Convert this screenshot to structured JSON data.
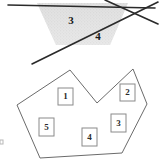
{
  "figure": {
    "width": 163,
    "height": 168,
    "background_color": "#ffffff"
  },
  "top_diagram": {
    "name": "intersecting-lines-with-shaded-region",
    "shaded_region": {
      "fill_color": "#e3e3e3",
      "pattern": "stippled-gray",
      "polygon_points": "37,3 128,3 110,45 56,45"
    },
    "lines": [
      {
        "name": "horizontal-line",
        "x1": 8,
        "y1": 5,
        "x2": 155,
        "y2": 8,
        "stroke_color": "#2a2a2a",
        "stroke_width": 1.6
      },
      {
        "name": "diagonal-line-rising",
        "x1": 32,
        "y1": 64,
        "x2": 158,
        "y2": 2,
        "stroke_color": "#2a2a2a",
        "stroke_width": 1.6
      },
      {
        "name": "diagonal-line-falling",
        "x1": 105,
        "y1": 0,
        "x2": 158,
        "y2": 24,
        "stroke_color": "#2a2a2a",
        "stroke_width": 1.6
      }
    ],
    "labels": [
      {
        "name": "angle-label-3",
        "text": "3",
        "x": 71,
        "y": 21
      },
      {
        "name": "angle-label-4",
        "text": "4",
        "x": 98,
        "y": 37
      }
    ]
  },
  "bottom_diagram": {
    "name": "concave-polygon-with-numbered-regions",
    "polygon": {
      "points": "70,70 97,103 133,69 147,104 122,153 40,158 17,105",
      "stroke_color": "#6b6b6b",
      "fill_color": "#ffffff"
    },
    "region_boxes": [
      {
        "name": "region-box-1",
        "label": "1",
        "x": 58,
        "y": 88,
        "w": 15,
        "h": 17
      },
      {
        "name": "region-box-2",
        "label": "2",
        "x": 120,
        "y": 84,
        "w": 15,
        "h": 17
      },
      {
        "name": "region-box-3",
        "label": "3",
        "x": 111,
        "y": 114,
        "w": 15,
        "h": 18
      },
      {
        "name": "region-box-4",
        "label": "4",
        "x": 82,
        "y": 128,
        "w": 15,
        "h": 18
      },
      {
        "name": "region-box-5",
        "label": "5",
        "x": 39,
        "y": 118,
        "w": 15,
        "h": 18
      }
    ]
  },
  "margin_mark": {
    "name": "left-margin-tick",
    "x": 0,
    "y": 140,
    "w": 3,
    "h": 4,
    "color": "#bbbbbb"
  }
}
